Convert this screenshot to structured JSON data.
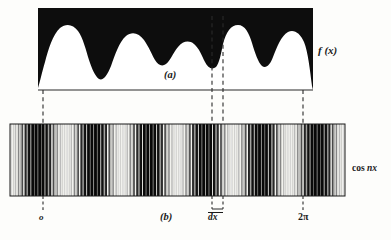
{
  "figure": {
    "title_hidden": "Fourier analysis figure: f(x) waveform and cos nx grating",
    "panel_a": {
      "label": "(a)",
      "curve_label": "f (x)",
      "panel_rect": {
        "x": 38,
        "y": 8,
        "width": 275,
        "height": 82
      },
      "ink_color": "#0d0d0d",
      "fill_color": "#ffffff"
    },
    "panel_b": {
      "label": "(b)",
      "grating_label_prefix": "cos ",
      "grating_label_italic": "nx",
      "panel_rect": {
        "x": 10,
        "y": 124,
        "width": 335,
        "height": 72
      },
      "ink_color": "#111111"
    },
    "axis_ticks": {
      "origin": "o",
      "interval": "dx",
      "end": "2π"
    },
    "dashed_guides": [
      {
        "name": "origin-guide",
        "x": 43
      },
      {
        "name": "dx-left-guide",
        "x": 212
      },
      {
        "name": "dx-right-guide",
        "x": 223
      },
      {
        "name": "twopi-guide",
        "x": 303
      }
    ]
  },
  "chart_data": {
    "type": "line",
    "title": "",
    "xlabel": "",
    "ylabel": "",
    "series": [
      {
        "name": "f (x)",
        "panel": "a",
        "description": "Arbitrary periodic waveform drawn as white region under black field",
        "x": [
          0,
          2,
          5,
          8,
          11,
          14,
          17,
          20,
          23,
          26,
          29,
          32,
          35,
          38,
          41,
          44,
          47,
          50,
          53,
          56,
          59,
          62,
          65,
          68,
          71,
          74,
          77,
          80,
          83,
          86,
          89,
          92,
          95,
          98,
          100
        ],
        "y": [
          0.02,
          0.18,
          0.42,
          0.62,
          0.8,
          0.91,
          0.95,
          0.9,
          0.74,
          0.5,
          0.33,
          0.3,
          0.42,
          0.6,
          0.74,
          0.82,
          0.84,
          0.83,
          0.78,
          0.68,
          0.58,
          0.52,
          0.55,
          0.66,
          0.8,
          0.92,
          0.97,
          0.93,
          0.8,
          0.66,
          0.6,
          0.68,
          0.84,
          0.93,
          0.1
        ],
        "ylim": [
          0,
          1
        ],
        "xlim": [
          0,
          100
        ]
      },
      {
        "name": "cos nx",
        "panel": "b",
        "description": "Vertical grating whose local line density/darkness follows cos(nx); alternating bright and dark bands across 0 to 2π",
        "cycles": 6,
        "n_lines": 96,
        "xlim": [
          0,
          1
        ]
      }
    ],
    "annotations": [
      {
        "text": "o",
        "x": 43,
        "panel": "b"
      },
      {
        "text": "dx",
        "x": 217,
        "panel": "b"
      },
      {
        "text": "2π",
        "x": 303,
        "panel": "b"
      }
    ],
    "grid": false,
    "legend": "none"
  }
}
